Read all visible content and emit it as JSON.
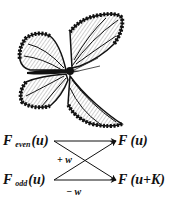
{
  "figure": {
    "illustration": "monarch-butterfly",
    "diagram": {
      "inputs": [
        {
          "name": "F",
          "subscript": "even",
          "arg": "(u)"
        },
        {
          "name": "F",
          "subscript": "odd",
          "arg": "(u)"
        }
      ],
      "outputs": [
        {
          "label": "F (u)"
        },
        {
          "label": "F (u+K)"
        }
      ],
      "weights": [
        {
          "label": "+ w"
        },
        {
          "label": "− w"
        }
      ]
    }
  }
}
